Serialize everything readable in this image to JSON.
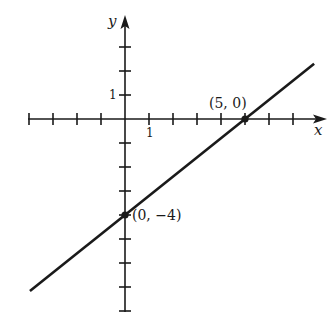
{
  "chart_data": {
    "type": "line",
    "title": "",
    "xlabel": "x",
    "ylabel": "y",
    "xlim": [
      -4,
      8
    ],
    "ylim": [
      -8,
      4
    ],
    "grid": false,
    "origin_px": [
      125,
      119
    ],
    "unit_px": 24,
    "tick_labels": {
      "x_one": "1",
      "y_one": "1"
    },
    "x_ticks": [
      -4,
      -3,
      -2,
      -1,
      1,
      2,
      3,
      4,
      5,
      6,
      7
    ],
    "y_ticks": [
      -8,
      -7,
      -6,
      -5,
      -4,
      -3,
      -2,
      -1,
      1,
      2,
      3
    ],
    "series": [
      {
        "name": "line",
        "equation": "y = 0.8x - 4",
        "x": [
          -3.96,
          7.88
        ],
        "y": [
          -7.17,
          2.3
        ]
      }
    ],
    "points": [
      {
        "x": 5,
        "y": 0,
        "label": "(5, 0)"
      },
      {
        "x": 0,
        "y": -4,
        "label": "(0, −4)"
      }
    ],
    "colors": {
      "ink": "#1a1a1a",
      "background": "#ffffff"
    }
  }
}
